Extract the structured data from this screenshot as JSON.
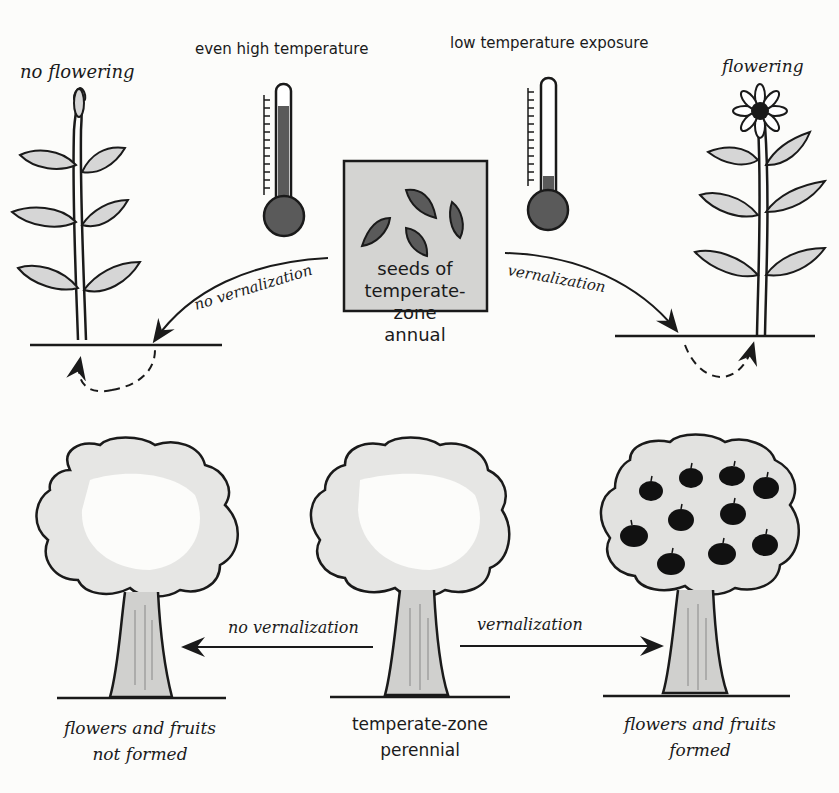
{
  "diagram": {
    "top": {
      "left_label": "no flowering",
      "right_label": "flowering",
      "left_thermometer_label": "even high temperature",
      "right_thermometer_label": "low temperature exposure",
      "center_box": {
        "line1": "seeds of",
        "line2": "temperate-",
        "line3": "zone",
        "line4": "annual"
      },
      "left_arrow_label": "no vernalization",
      "right_arrow_label": "vernalization"
    },
    "bottom": {
      "center_label_line1": "temperate-zone",
      "center_label_line2": "perennial",
      "left_caption_line1": "flowers and fruits",
      "left_caption_line2": "not formed",
      "right_caption_line1": "flowers and fruits",
      "right_caption_line2": "formed",
      "left_arrow_label": "no vernalization",
      "right_arrow_label": "vernalization"
    },
    "colors": {
      "ink": "#1a1a1a",
      "fill_gray": "#5a5a5a",
      "box_gray": "#d4d4d2",
      "leaf_gray": "#d6d6d6",
      "canopy_gray": "#dcdcdc"
    }
  }
}
